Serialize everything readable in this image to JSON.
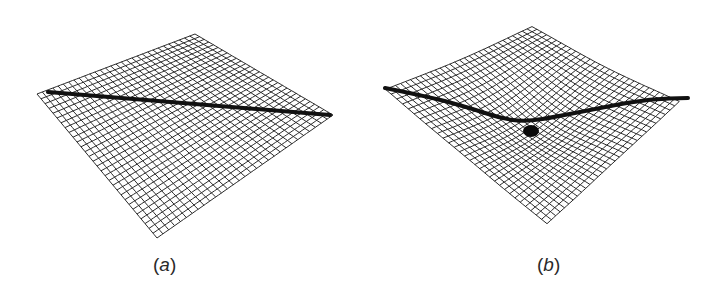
{
  "figure": {
    "panels": [
      {
        "id": "a",
        "label_open": "(",
        "label_letter": "a",
        "label_close": ")",
        "description": "flat spacetime grid with straight path",
        "grid_lines": 30,
        "corners": {
          "top": [
            195,
            34
          ],
          "right": [
            333,
            115
          ],
          "bottom": [
            157,
            238
          ],
          "left": [
            37,
            94
          ]
        },
        "path": [
          [
            48,
            92
          ],
          [
            330,
            115
          ]
        ],
        "warp": null
      },
      {
        "id": "b",
        "label_open": "(",
        "label_letter": "b",
        "label_close": ")",
        "description": "curved spacetime grid around mass with bent path",
        "grid_lines": 30,
        "corners": {
          "top": [
            532,
            25
          ],
          "right": [
            680,
            100
          ],
          "bottom": [
            547,
            223
          ],
          "left": [
            385,
            88
          ]
        },
        "path": [
          [
            385,
            88
          ],
          [
            430,
            97
          ],
          [
            470,
            108
          ],
          [
            500,
            118
          ],
          [
            525,
            122
          ],
          [
            560,
            116
          ],
          [
            610,
            106
          ],
          [
            650,
            99
          ],
          [
            688,
            98
          ]
        ],
        "warp": {
          "center": [
            532,
            122
          ],
          "depth": 14,
          "radius": 70
        },
        "mass": {
          "cx": 531,
          "cy": 131,
          "rx": 8,
          "ry": 6
        }
      }
    ],
    "colors": {
      "grid": "#2b2b2b",
      "path": "#111111",
      "mass": "#0a0a0a",
      "background": "#ffffff"
    }
  }
}
